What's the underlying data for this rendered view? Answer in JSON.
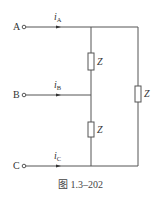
{
  "figure": {
    "caption": "图 1.3–202",
    "terminals": [
      {
        "label": "A",
        "current": "i",
        "current_sub": "A"
      },
      {
        "label": "B",
        "current": "i",
        "current_sub": "B"
      },
      {
        "label": "C",
        "current": "i",
        "current_sub": "C"
      }
    ],
    "impedances": [
      {
        "label": "Z",
        "position": "upper-middle"
      },
      {
        "label": "Z",
        "position": "lower-middle"
      },
      {
        "label": "Z",
        "position": "right"
      }
    ],
    "colors": {
      "wire": "#555555",
      "text": "#333333"
    }
  }
}
